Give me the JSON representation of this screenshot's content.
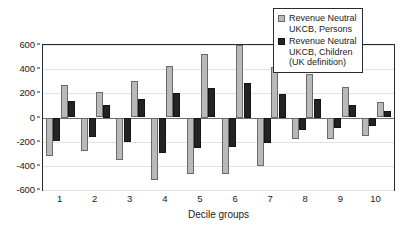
{
  "chart_data": {
    "type": "bar",
    "title": "",
    "xlabel": "Decile groups",
    "ylabel": "",
    "categories": [
      "1",
      "2",
      "3",
      "4",
      "5",
      "6",
      "7",
      "8",
      "9",
      "10"
    ],
    "ylim": [
      -600,
      600
    ],
    "yticks": [
      600,
      400,
      200,
      0,
      -200,
      -400,
      -600
    ],
    "ytick_labels": [
      "600",
      "400",
      "200",
      "0",
      "-200",
      "-400",
      "-600"
    ],
    "grid": true,
    "legend_position": "top-right",
    "series": [
      {
        "name": "Revenue Neutral\nUKCB, Persons",
        "color": "#b9b9b9",
        "negative_values": [
          -320,
          -275,
          -350,
          -515,
          -470,
          -465,
          -405,
          -180,
          -175,
          -150
        ],
        "positive_values": [
          270,
          215,
          305,
          430,
          525,
          600,
          420,
          360,
          250,
          130
        ]
      },
      {
        "name": "Revenue Neutral\nUKCB, Children\n(UK definition)",
        "color": "#232323",
        "negative_values": [
          -195,
          -160,
          -200,
          -290,
          -250,
          -245,
          -210,
          -105,
          -90,
          -70
        ],
        "positive_values": [
          140,
          105,
          155,
          205,
          245,
          285,
          195,
          150,
          100,
          50
        ]
      }
    ]
  },
  "legend": {
    "items": [
      {
        "label": "Revenue Neutral\nUKCB, Persons",
        "swatch": "light"
      },
      {
        "label": "Revenue Neutral\nUKCB, Children\n(UK definition)",
        "swatch": "dark"
      }
    ]
  },
  "axes": {
    "x_title": "Decile groups"
  }
}
